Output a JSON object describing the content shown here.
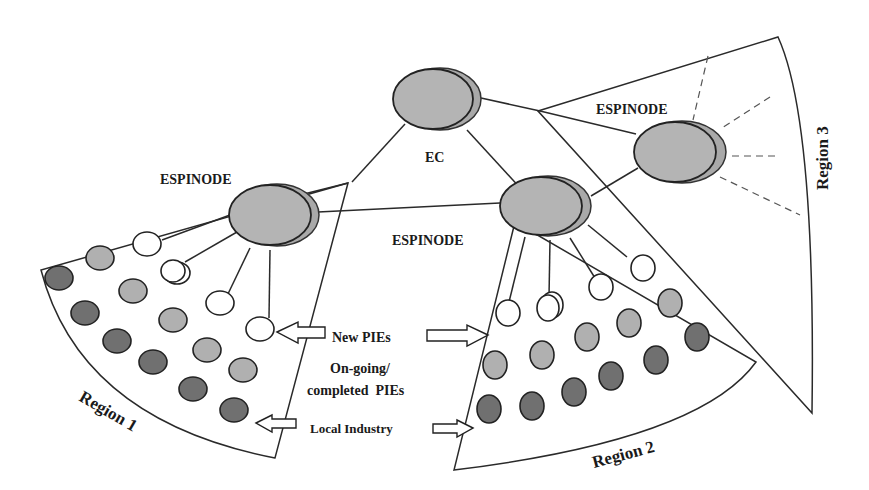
{
  "diagram": {
    "nodes": {
      "ec": {
        "label": "EC"
      },
      "espinode_1": {
        "label": "ESPINODE"
      },
      "espinode_2": {
        "label": "ESPINODE"
      },
      "espinode_3": {
        "label": "ESPINODE"
      }
    },
    "regions": {
      "region_1": {
        "label": "Region 1"
      },
      "region_2": {
        "label": "Region 2"
      },
      "region_3": {
        "label": "Region 3"
      }
    },
    "legend": {
      "new_pies": "New PIEs",
      "ongoing_line1": "On-going/",
      "ongoing_line2": "completed  PIEs",
      "local_industry": "Local Industry"
    },
    "colors": {
      "ongoing_pie": "#b0b0b0",
      "local_industry": "#707070",
      "new_pie": "#ffffff",
      "node_fill": "#b4b4b4"
    }
  }
}
